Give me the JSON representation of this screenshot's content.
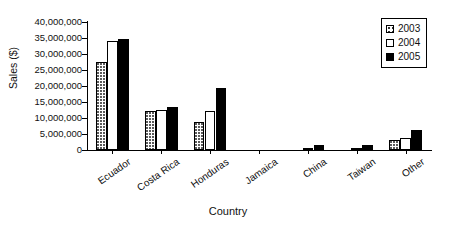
{
  "chart_data": {
    "type": "bar",
    "title": "",
    "xlabel": "Country",
    "ylabel": "Sales ($)",
    "categories": [
      "Ecuador",
      "Costa Rica",
      "Honduras",
      "Jamaica",
      "China",
      "Taiwan",
      "Other"
    ],
    "series": [
      {
        "name": "2003",
        "values": [
          27500000,
          12200000,
          8700000,
          0,
          0,
          0,
          3000000
        ]
      },
      {
        "name": "2004",
        "values": [
          34000000,
          12500000,
          12100000,
          0,
          200000,
          200000,
          3600000
        ]
      },
      {
        "name": "2005",
        "values": [
          34700000,
          13500000,
          19400000,
          0,
          1700000,
          1600000,
          6100000
        ]
      }
    ],
    "ylim": [
      0,
      40000000
    ],
    "ytick_labels": [
      "40,000,000",
      "35,000,000",
      "30,000,000",
      "25,000,000",
      "20,000,000",
      "15,000,000",
      "10,000,000",
      "5,000,000",
      "0"
    ],
    "ytick_values": [
      40000000,
      35000000,
      30000000,
      25000000,
      20000000,
      15000000,
      10000000,
      5000000,
      0
    ],
    "grid": false,
    "legend_position": "top-right",
    "legend_entries": [
      "2003",
      "2004",
      "2005"
    ],
    "colors": {
      "series_2003": "#ffffff",
      "series_2004": "#ffffff",
      "series_2005": "#000000",
      "axis": "#000000",
      "text": "#111111"
    }
  }
}
